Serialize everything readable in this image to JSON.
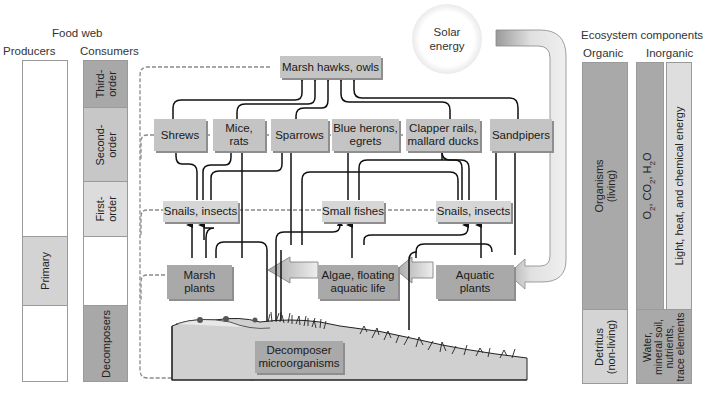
{
  "left_panel": {
    "title": "Food web",
    "producers_header": "Producers",
    "consumers_header": "Consumers",
    "producers_bands": [
      {
        "label": "",
        "shade": "#ffffff"
      },
      {
        "label": "Primary",
        "shade": "#d3d3d3"
      },
      {
        "label": "",
        "shade": "#ffffff"
      }
    ],
    "consumer_bands": [
      {
        "label": "Third-\norder",
        "shade": "#a8a8a8"
      },
      {
        "label": "Second-\norder",
        "shade": "#c7c7c7"
      },
      {
        "label": "First-\norder",
        "shade": "#dcdcdc"
      },
      {
        "label": "",
        "shade": "#ffffff"
      },
      {
        "label": "Decomposers",
        "shade": "#a8a8a8"
      }
    ]
  },
  "solar": {
    "label_line1": "Solar",
    "label_line2": "energy"
  },
  "food_web": {
    "third_order": [
      {
        "id": "marsh-hawks-owls",
        "label": "Marsh hawks, owls"
      }
    ],
    "second_order": [
      {
        "id": "shrews",
        "line1": "Shrews",
        "line2": ""
      },
      {
        "id": "mice-rats",
        "line1": "Mice,",
        "line2": "rats"
      },
      {
        "id": "sparrows",
        "line1": "Sparrows",
        "line2": ""
      },
      {
        "id": "blue-herons-egrets",
        "line1": "Blue herons,",
        "line2": "egrets"
      },
      {
        "id": "clapper-rails-mallard-ducks",
        "line1": "Clapper rails,",
        "line2": "mallard ducks"
      },
      {
        "id": "sandpipers",
        "line1": "Sandpipers",
        "line2": ""
      }
    ],
    "first_order": [
      {
        "id": "snails-insects-left",
        "label": "Snails, insects"
      },
      {
        "id": "small-fishes",
        "label": "Small fishes"
      },
      {
        "id": "snails-insects-right",
        "label": "Snails, insects"
      }
    ],
    "producers": [
      {
        "id": "marsh-plants",
        "line1": "Marsh",
        "line2": "plants"
      },
      {
        "id": "algae-floating-aquatic-life",
        "line1": "Algae, floating",
        "line2": "aquatic life"
      },
      {
        "id": "aquatic-plants",
        "line1": "Aquatic",
        "line2": "plants"
      }
    ],
    "decomposers": {
      "id": "decomposer-microorganisms",
      "line1": "Decomposer",
      "line2": "microorganisms"
    }
  },
  "right_panel": {
    "title": "Ecosystem components",
    "organic_header": "Organic",
    "inorganic_header": "Inorganic",
    "organic_bands": [
      {
        "line1": "Organisms",
        "line2": "(living)",
        "shade": "#a9a9a9"
      },
      {
        "line1": "Detritus",
        "line2": "(non-living)",
        "shade": "#d4d4d4"
      }
    ],
    "inorganic_gases": {
      "text": "O2, CO2, H2O",
      "shade": "#a9a9a9"
    },
    "inorganic_energy": {
      "text": "Light, heat, and chemical energy",
      "shade": "#dedede"
    },
    "inorganic_soil": {
      "line1": "Water,",
      "line2": "mineral soil,",
      "line3": "nutrients,",
      "line4": "trace elements",
      "shade": "#a9a9a9"
    }
  },
  "colors": {
    "node_fill": "#c4c4c4",
    "node_shadow": "#8e8e8e",
    "arrow": "#111111",
    "dashed": "#8a8a8a",
    "big_arrow_fill": "#c8c8c8"
  }
}
